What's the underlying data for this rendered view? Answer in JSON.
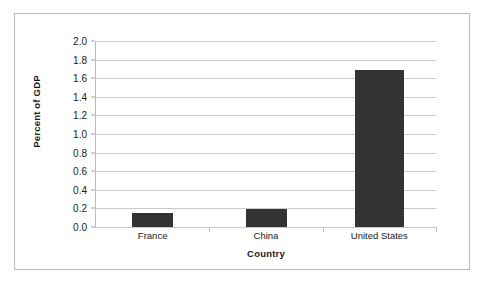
{
  "chart_data": {
    "type": "bar",
    "title": "",
    "subtitle": "",
    "xlabel": "Country",
    "ylabel": "Percent of GDP",
    "categories": [
      "France",
      "China",
      "United States"
    ],
    "values": [
      0.15,
      0.19,
      1.69
    ],
    "ylim": [
      0.0,
      2.0
    ],
    "ytick_step": 0.2,
    "yticks": [
      "2.0",
      "1.8",
      "1.6",
      "1.4",
      "1.2",
      "1.0",
      "0.8",
      "0.6",
      "0.4",
      "0.2",
      "0.0"
    ],
    "grid": true,
    "legend": false,
    "legend_position": "none",
    "series": [
      {
        "name": "Percent of GDP",
        "values": [
          0.15,
          0.19,
          1.69
        ]
      }
    ],
    "colors": {
      "bar": "#333333",
      "gridline": "#c9c9c9",
      "axis": "#bdbdbd",
      "text": "#1a1a1a",
      "background": "#ffffff",
      "frame_border": "#b9b9b9"
    }
  }
}
